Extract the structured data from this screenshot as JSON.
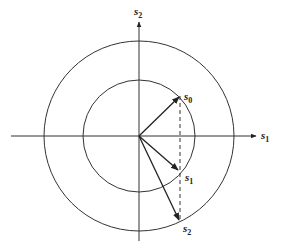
{
  "figure": {
    "center": [
      139,
      136
    ],
    "inner_radius": 56,
    "outer_radius": 95,
    "stroke_color": "#333333",
    "axes": {
      "horizontal": {
        "label": "s",
        "subscript": "1"
      },
      "vertical": {
        "label": "s",
        "subscript": "2"
      }
    },
    "vectors": [
      {
        "name": "s0",
        "label": "s",
        "subscript": "0",
        "end": [
          180,
          96
        ]
      },
      {
        "name": "s1",
        "label": "s",
        "subscript": "1",
        "end": [
          180,
          171
        ]
      },
      {
        "name": "s2",
        "label": "s",
        "subscript": "2",
        "end": [
          180,
          222
        ]
      }
    ],
    "dashed_line": {
      "x": 180,
      "y_start": 96,
      "y_end": 222
    }
  }
}
